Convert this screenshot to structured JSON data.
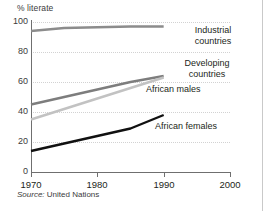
{
  "figure": {
    "ylabel": "% literate",
    "source_prefix": "Source:",
    "source_text": " United Nations"
  },
  "chart_data": {
    "type": "line",
    "title": "",
    "xlabel": "",
    "ylabel": "% literate",
    "xlim": [
      1970,
      2000
    ],
    "ylim": [
      0,
      100
    ],
    "yticks": [
      0,
      20,
      40,
      60,
      80,
      100
    ],
    "xticks": [
      1970,
      1980,
      1990,
      2000
    ],
    "grid": "horizontal dotted",
    "legend_position": "inline-at-line-end",
    "source": "Source: United Nations",
    "series": [
      {
        "name": "Industrial countries",
        "label": "Industrial",
        "label2": "countries",
        "color": "#8c8c8c",
        "x": [
          1970,
          1975,
          1980,
          1985,
          1990
        ],
        "values": [
          94,
          96,
          96.5,
          97,
          97
        ]
      },
      {
        "name": "Developing countries",
        "label": "Developing",
        "label2": "countries",
        "color": "#7d7d7d",
        "x": [
          1970,
          1975,
          1980,
          1985,
          1990
        ],
        "values": [
          45,
          50,
          55,
          60,
          64
        ]
      },
      {
        "name": "African males",
        "label": "African males",
        "label2": "",
        "color": "#c2c2c2",
        "x": [
          1970,
          1975,
          1980,
          1985,
          1990
        ],
        "values": [
          35,
          42,
          49,
          56,
          63
        ]
      },
      {
        "name": "African females",
        "label": "African females",
        "label2": "",
        "color": "#111111",
        "x": [
          1970,
          1975,
          1980,
          1985,
          1990
        ],
        "values": [
          14,
          19,
          24,
          29,
          38
        ]
      }
    ]
  },
  "yticks": {
    "t100": "100",
    "t80": "80",
    "t60": "60",
    "t40": "40",
    "t20": "20",
    "t0": "0"
  },
  "xticks": {
    "t1970": "1970",
    "t1980": "1980",
    "t1990": "1990",
    "t2000": "2000"
  },
  "labels": {
    "industrial_1": "Industrial",
    "industrial_2": "countries",
    "developing_1": "Developing",
    "developing_2": "countries",
    "african_males": "African males",
    "african_females": "African females"
  }
}
